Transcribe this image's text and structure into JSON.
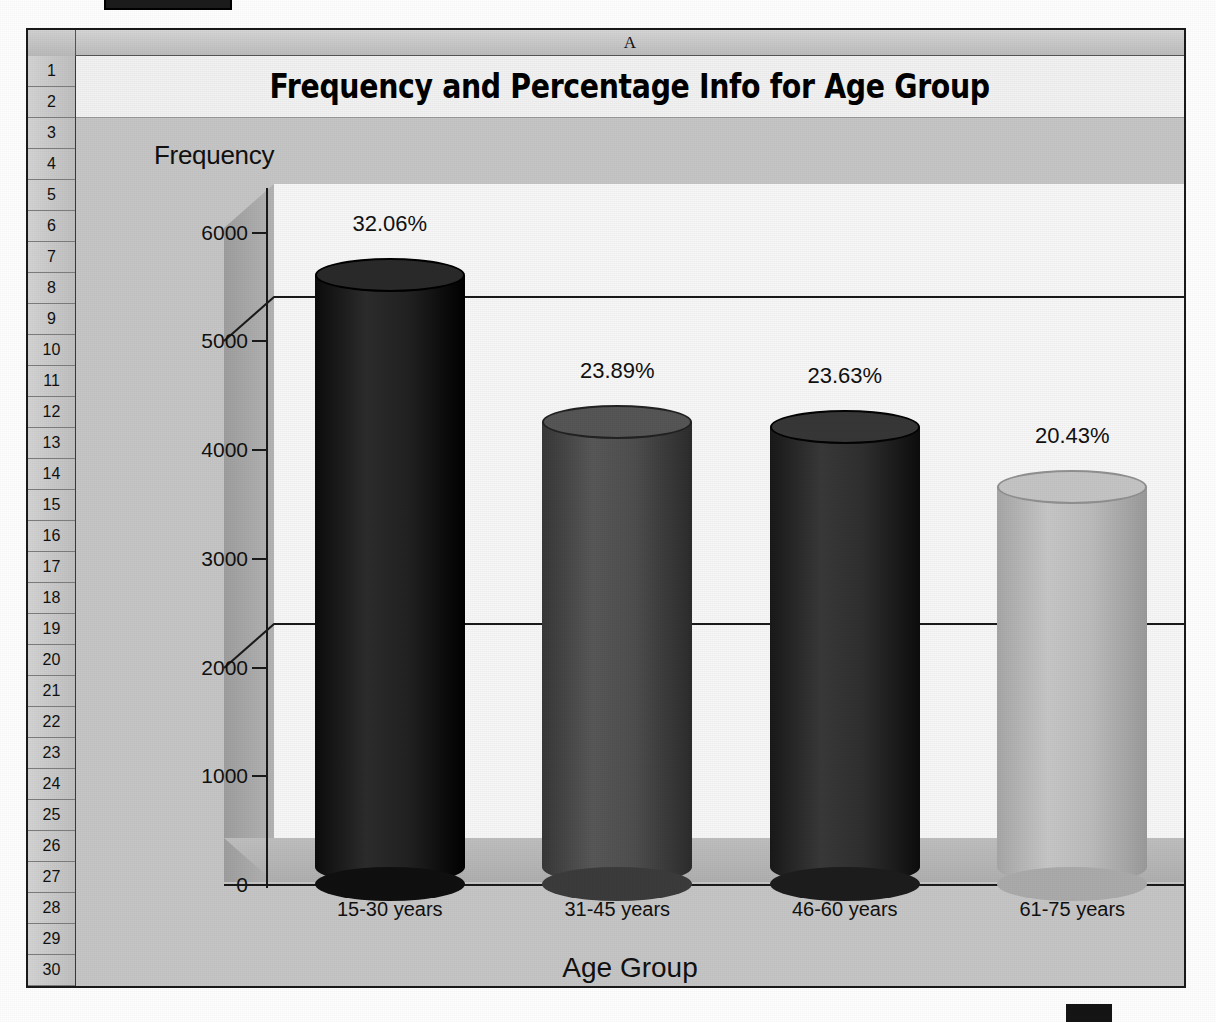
{
  "spreadsheet": {
    "column_header": "A",
    "row_numbers": [
      "1",
      "2",
      "3",
      "4",
      "5",
      "6",
      "7",
      "8",
      "9",
      "10",
      "11",
      "12",
      "13",
      "14",
      "15",
      "16",
      "17",
      "18",
      "19",
      "20",
      "21",
      "22",
      "23",
      "24",
      "25",
      "26",
      "27",
      "28",
      "29",
      "30"
    ]
  },
  "chart_data": {
    "type": "bar",
    "title": "Frequency and Percentage Info for Age Group",
    "xlabel": "Age Group",
    "ylabel": "Frequency",
    "categories": [
      "15-30 years",
      "31-45 years",
      "46-60 years",
      "61-75 years"
    ],
    "values": [
      5600,
      4250,
      4200,
      3650
    ],
    "data_labels": [
      "32.06%",
      "23.89%",
      "23.63%",
      "20.43%"
    ],
    "percentages": [
      32.06,
      23.89,
      23.63,
      20.43
    ],
    "ytick_labels": [
      "6000",
      "5000",
      "4000",
      "3000",
      "2000",
      "1000",
      "0"
    ],
    "ytick_values": [
      6000,
      5000,
      4000,
      3000,
      2000,
      1000,
      0
    ],
    "ylim": [
      0,
      6400
    ],
    "grid": true,
    "gridline_values": [
      5000,
      2000
    ],
    "legend": "none",
    "style": "3d-cylinder",
    "series_colors": [
      "#1e1e1e",
      "#4a4a4a",
      "#2b2b2b",
      "#b9b9b9"
    ]
  }
}
